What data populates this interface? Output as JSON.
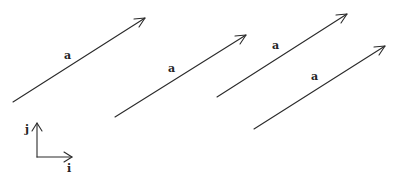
{
  "diagram": {
    "stroke_color": "#2a2a2a",
    "vectors": [
      {
        "label": "a",
        "start": [
          13,
          102
        ],
        "end": [
          145,
          18
        ],
        "label_pos": [
          64,
          50
        ]
      },
      {
        "label": "a",
        "start": [
          115,
          117
        ],
        "end": [
          246,
          35
        ],
        "label_pos": [
          168,
          63
        ]
      },
      {
        "label": "a",
        "start": [
          217,
          97
        ],
        "end": [
          347,
          14
        ],
        "label_pos": [
          272,
          40
        ]
      },
      {
        "label": "a",
        "start": [
          254,
          129
        ],
        "end": [
          385,
          46
        ],
        "label_pos": [
          311,
          71
        ]
      }
    ],
    "axes": {
      "origin": [
        37,
        157
      ],
      "i_end": [
        72,
        157
      ],
      "j_end": [
        37,
        123
      ],
      "i_label": "i",
      "j_label": "j"
    }
  }
}
